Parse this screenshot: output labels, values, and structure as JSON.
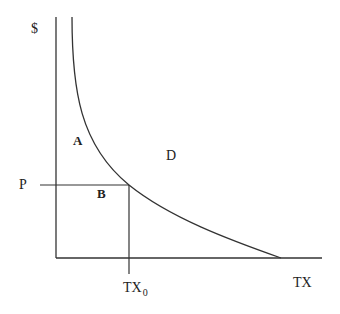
{
  "diagram": {
    "type": "demand-curve",
    "y_axis_label": "$",
    "x_axis_label": "TX",
    "price_label": "P",
    "quantity_label_main": "TX",
    "quantity_label_sub": "0",
    "regions": {
      "a": "A",
      "b": "B",
      "d": "D"
    },
    "colors": {
      "line": "#333333",
      "text": "#222222",
      "background": "#ffffff"
    }
  }
}
